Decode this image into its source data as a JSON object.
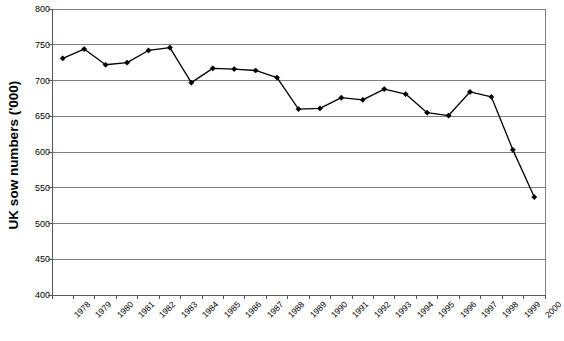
{
  "chart_data": {
    "type": "line",
    "title": "",
    "xlabel": "",
    "ylabel": "UK sow numbers ('000)",
    "ylim": [
      400,
      800
    ],
    "ytick_step": 50,
    "yticks": [
      400,
      450,
      500,
      550,
      600,
      650,
      700,
      750,
      800
    ],
    "grid": "horizontal",
    "legend": "none",
    "marker": "filled-diamond",
    "line_color": "#000000",
    "marker_color": "#000000",
    "grid_color": "#808080",
    "background": "#ffffff",
    "categories": [
      "1978",
      "1979",
      "1980",
      "1981",
      "1982",
      "1983",
      "1984",
      "1985",
      "1986",
      "1987",
      "1988",
      "1989",
      "1990",
      "1991",
      "1992",
      "1993",
      "1994",
      "1995",
      "1996",
      "1997",
      "1998",
      "1999",
      "2000"
    ],
    "values": [
      731,
      744,
      722,
      725,
      742,
      746,
      697,
      717,
      716,
      714,
      704,
      660,
      661,
      676,
      673,
      688,
      681,
      655,
      651,
      684,
      677,
      603,
      537
    ],
    "series": [
      {
        "name": "UK sow numbers ('000)",
        "values": [
          731,
          744,
          722,
          725,
          742,
          746,
          697,
          717,
          716,
          714,
          704,
          660,
          661,
          676,
          673,
          688,
          681,
          655,
          651,
          684,
          677,
          603,
          537
        ]
      }
    ]
  },
  "axis": {
    "y_title": "UK sow numbers ('000)",
    "y_tick_labels": [
      "800",
      "750",
      "700",
      "650",
      "600",
      "550",
      "500",
      "450",
      "400"
    ],
    "x_tick_labels": [
      "1978",
      "1979",
      "1980",
      "1981",
      "1982",
      "1983",
      "1984",
      "1985",
      "1986",
      "1987",
      "1988",
      "1989",
      "1990",
      "1991",
      "1992",
      "1993",
      "1994",
      "1995",
      "1996",
      "1997",
      "1998",
      "1999",
      "2000"
    ]
  },
  "caption": ""
}
